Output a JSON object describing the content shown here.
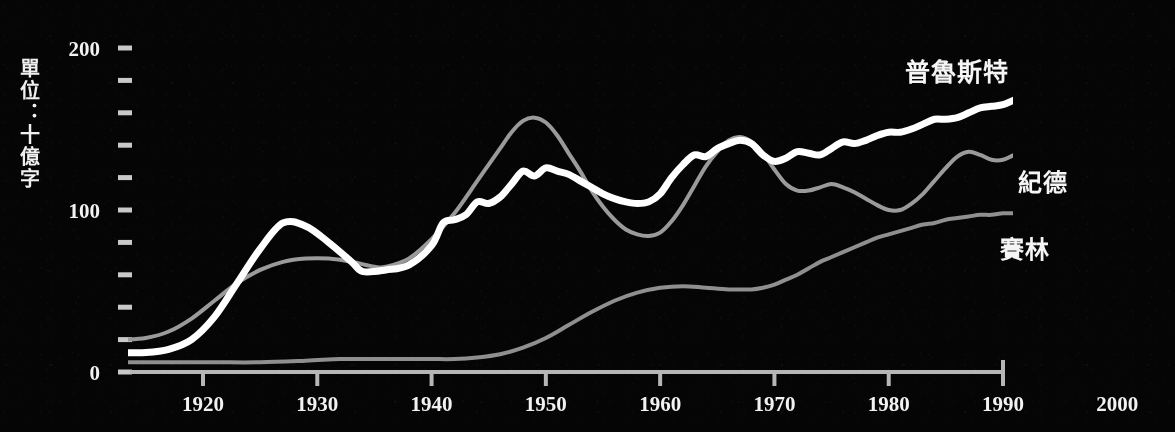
{
  "figure": {
    "background_color": "#050505",
    "unit_label": "單位：十億字",
    "x_axis": {
      "ticks": [
        1920,
        1930,
        1940,
        1950,
        1960,
        1970,
        1980,
        1990,
        2000
      ],
      "tick_labels": [
        "1920",
        "1930",
        "1940",
        "1950",
        "1960",
        "1970",
        "1980",
        "1990",
        "2000"
      ],
      "range": [
        1913,
        2000
      ],
      "axis_line_end": 1992
    },
    "y_axis": {
      "major_ticks": [
        0,
        100,
        200
      ],
      "major_tick_labels": [
        "0",
        "100",
        "200"
      ],
      "minor_tick_step": 20,
      "range": [
        0,
        200
      ]
    },
    "series_labels": {
      "proust": "普魯斯特",
      "gide": "紀德",
      "celine": "賽林"
    }
  },
  "chart_data": {
    "type": "line",
    "title": "",
    "xlabel": "",
    "ylabel": "單位：十億字",
    "xlim": [
      1913,
      2000
    ],
    "ylim": [
      0,
      200
    ],
    "grid": false,
    "legend_position": "right-inline",
    "xticks": [
      1920,
      1930,
      1940,
      1950,
      1960,
      1970,
      1980,
      1990,
      2000
    ],
    "yticks": [
      0,
      100,
      200
    ],
    "yticks_minor": [
      20,
      40,
      60,
      80,
      120,
      140,
      160,
      180
    ],
    "series": [
      {
        "name": "普魯斯特",
        "color": "#ffffff",
        "width": 7,
        "x": [
          1913,
          1915,
          1917,
          1919,
          1921,
          1923,
          1925,
          1927,
          1929,
          1931,
          1933,
          1934,
          1936,
          1938,
          1940,
          1941,
          1942,
          1943,
          1944,
          1945,
          1946,
          1947,
          1948,
          1949,
          1950,
          1951,
          1952,
          1953,
          1954,
          1955,
          1956,
          1957,
          1958,
          1959,
          1960,
          1961,
          1962,
          1963,
          1964,
          1965,
          1966,
          1967,
          1968,
          1969,
          1970,
          1971,
          1972,
          1973,
          1974,
          1975,
          1976,
          1977,
          1978,
          1979,
          1980,
          1981,
          1982,
          1983,
          1984,
          1985,
          1986,
          1987,
          1988,
          1989,
          1990,
          1991,
          1992
        ],
        "y": [
          12,
          12,
          14,
          20,
          34,
          55,
          76,
          92,
          90,
          80,
          68,
          62,
          63,
          66,
          78,
          92,
          94,
          97,
          105,
          104,
          108,
          116,
          124,
          121,
          126,
          124,
          122,
          118,
          114,
          110,
          107,
          105,
          104,
          105,
          110,
          120,
          128,
          134,
          133,
          138,
          141,
          143,
          141,
          134,
          130,
          132,
          136,
          135,
          134,
          138,
          142,
          141,
          143,
          146,
          148,
          148,
          150,
          153,
          156,
          156,
          157,
          160,
          163,
          164,
          165,
          168,
          170
        ]
      },
      {
        "name": "紀德",
        "color": "#9a9a9a",
        "width": 4,
        "x": [
          1913,
          1915,
          1917,
          1919,
          1921,
          1923,
          1925,
          1927,
          1929,
          1931,
          1933,
          1935,
          1936,
          1938,
          1940,
          1942,
          1944,
          1945,
          1946,
          1947,
          1948,
          1949,
          1950,
          1951,
          1952,
          1953,
          1954,
          1955,
          1956,
          1957,
          1958,
          1959,
          1960,
          1961,
          1962,
          1963,
          1964,
          1965,
          1966,
          1967,
          1968,
          1969,
          1970,
          1971,
          1972,
          1973,
          1974,
          1975,
          1976,
          1977,
          1978,
          1979,
          1980,
          1981,
          1982,
          1983,
          1984,
          1985,
          1986,
          1987,
          1988,
          1989,
          1990,
          1991,
          1992
        ],
        "y": [
          20,
          21,
          25,
          33,
          44,
          55,
          63,
          68,
          70,
          70,
          68,
          65,
          65,
          70,
          82,
          98,
          118,
          128,
          138,
          148,
          155,
          157,
          154,
          146,
          135,
          124,
          112,
          102,
          94,
          88,
          85,
          84,
          86,
          93,
          103,
          115,
          127,
          136,
          143,
          145,
          142,
          135,
          125,
          116,
          112,
          112,
          114,
          116,
          114,
          111,
          107,
          103,
          100,
          100,
          104,
          110,
          118,
          126,
          133,
          136,
          134,
          131,
          131,
          134,
          136
        ]
      },
      {
        "name": "賽林",
        "color": "#8f8f8f",
        "width": 4,
        "x": [
          1913,
          1917,
          1921,
          1925,
          1929,
          1932,
          1934,
          1936,
          1938,
          1940,
          1942,
          1944,
          1946,
          1948,
          1950,
          1952,
          1954,
          1956,
          1958,
          1960,
          1962,
          1964,
          1966,
          1968,
          1969,
          1970,
          1971,
          1972,
          1973,
          1974,
          1975,
          1976,
          1977,
          1978,
          1979,
          1980,
          1981,
          1982,
          1983,
          1984,
          1985,
          1986,
          1987,
          1988,
          1989,
          1990,
          1991,
          1992
        ],
        "y": [
          6,
          6,
          6,
          6,
          7,
          8,
          8,
          8,
          8,
          8,
          8,
          9,
          11,
          15,
          21,
          29,
          37,
          44,
          49,
          52,
          53,
          52,
          51,
          51,
          52,
          54,
          57,
          60,
          64,
          68,
          71,
          74,
          77,
          80,
          83,
          85,
          87,
          89,
          91,
          92,
          94,
          95,
          96,
          97,
          97,
          98,
          98,
          99
        ]
      }
    ]
  }
}
